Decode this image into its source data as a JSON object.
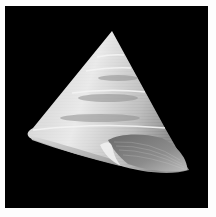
{
  "image": {
    "subject": "cone-shaped top shell (trochid gastropod) on black background",
    "alt": "Top shell specimen photograph",
    "colors": {
      "background": "#000000",
      "border": "#fdfdfd",
      "shell_light": "#e6e6e6",
      "shell_mid": "#a8a8a8",
      "shell_dark": "#5a5a5a"
    }
  }
}
